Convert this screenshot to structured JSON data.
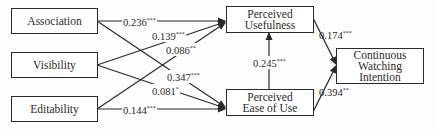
{
  "diagram": {
    "type": "path-model",
    "nodes": [
      {
        "id": "association",
        "label": "Association"
      },
      {
        "id": "visibility",
        "label": "Visibility"
      },
      {
        "id": "editability",
        "label": "Editability"
      },
      {
        "id": "pu",
        "label_line1": "Perceived",
        "label_line2": "Usefulness"
      },
      {
        "id": "peou",
        "label_line1": "Perceived",
        "label_line2": "Ease of Use"
      },
      {
        "id": "cwi",
        "label_line1": "Continuous",
        "label_line2": "Watching",
        "label_line3": "Intention"
      }
    ],
    "edges": [
      {
        "from": "association",
        "to": "pu",
        "coef": "0.236",
        "sig": "***"
      },
      {
        "from": "visibility",
        "to": "pu",
        "coef": "0.139",
        "sig": "***"
      },
      {
        "from": "editability",
        "to": "pu",
        "coef": "0.086",
        "sig": "**"
      },
      {
        "from": "association",
        "to": "peou",
        "coef": "0.347",
        "sig": "***"
      },
      {
        "from": "visibility",
        "to": "peou",
        "coef": "0.081",
        "sig": "*"
      },
      {
        "from": "editability",
        "to": "peou",
        "coef": "0.144",
        "sig": "***"
      },
      {
        "from": "peou",
        "to": "pu",
        "coef": "0.245",
        "sig": "***"
      },
      {
        "from": "pu",
        "to": "cwi",
        "coef": "0.174",
        "sig": "***"
      },
      {
        "from": "peou",
        "to": "cwi",
        "coef": "0.394",
        "sig": "**"
      }
    ]
  }
}
